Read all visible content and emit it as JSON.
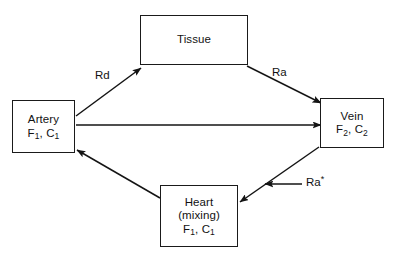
{
  "diagram": {
    "nodes": [
      {
        "id": "tissue",
        "name": "Tissue",
        "lines": [
          "Tissue"
        ]
      },
      {
        "id": "artery",
        "name": "Artery",
        "lines": [
          "Artery",
          "F1, C1"
        ],
        "symbol_flow": "F",
        "symbol_flow_sub": "1",
        "symbol_conc": "C",
        "symbol_conc_sub": "1"
      },
      {
        "id": "vein",
        "name": "Vein",
        "lines": [
          "Vein",
          "F2, C2"
        ],
        "symbol_flow": "F",
        "symbol_flow_sub": "2",
        "symbol_conc": "C",
        "symbol_conc_sub": "2"
      },
      {
        "id": "heart",
        "name": "Heart",
        "lines": [
          "Heart",
          "(mixing)",
          "F1, C1"
        ],
        "qualifier": "(mixing)",
        "symbol_flow": "F",
        "symbol_flow_sub": "1",
        "symbol_conc": "C",
        "symbol_conc_sub": "1"
      }
    ],
    "edges": [
      {
        "id": "artery-to-tissue",
        "from": "artery",
        "to": "tissue",
        "label": "Rd",
        "meaning": "rate of disappearance"
      },
      {
        "id": "tissue-to-vein",
        "from": "tissue",
        "to": "vein",
        "label": "Ra",
        "meaning": "rate of appearance"
      },
      {
        "id": "artery-to-vein",
        "from": "artery",
        "to": "vein",
        "label": ""
      },
      {
        "id": "vein-to-heart",
        "from": "vein",
        "to": "heart",
        "label": ""
      },
      {
        "id": "heart-to-artery",
        "from": "heart",
        "to": "artery",
        "label": ""
      },
      {
        "id": "tracer-infusion-to-vein-heart",
        "from": "external",
        "to": "vein-to-heart",
        "label": "Ra*",
        "label_base": "Ra",
        "label_superscript": "*",
        "meaning": "tracer rate of appearance"
      }
    ],
    "colors": {
      "stroke": "#1a1a1a",
      "text": "#121212",
      "background": "#ffffff"
    }
  }
}
